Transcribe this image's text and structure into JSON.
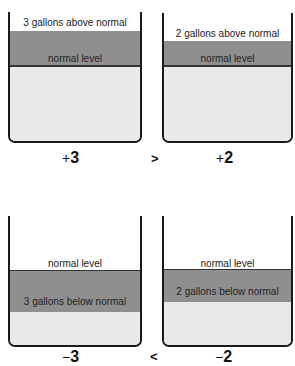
{
  "colors": {
    "above_band": "#8f8f8f",
    "water": "#e9e9e9",
    "outline": "#1a1a1a"
  },
  "top_row": {
    "left": {
      "label_above": "3 gallons above normal",
      "label_normal": "normal  level",
      "sign": "+",
      "value": "3"
    },
    "comparison": ">",
    "right": {
      "label_above": "2 gallons above normal",
      "label_normal": "normal  level",
      "sign": "+",
      "value": "2"
    }
  },
  "bottom_row": {
    "left": {
      "label_normal": "normal  level",
      "label_below": "3 gallons below normal",
      "sign": "−",
      "value": "3"
    },
    "comparison": "<",
    "right": {
      "label_normal": "normal  level",
      "label_below": "2 gallons below normal",
      "sign": "−",
      "value": "2"
    }
  }
}
